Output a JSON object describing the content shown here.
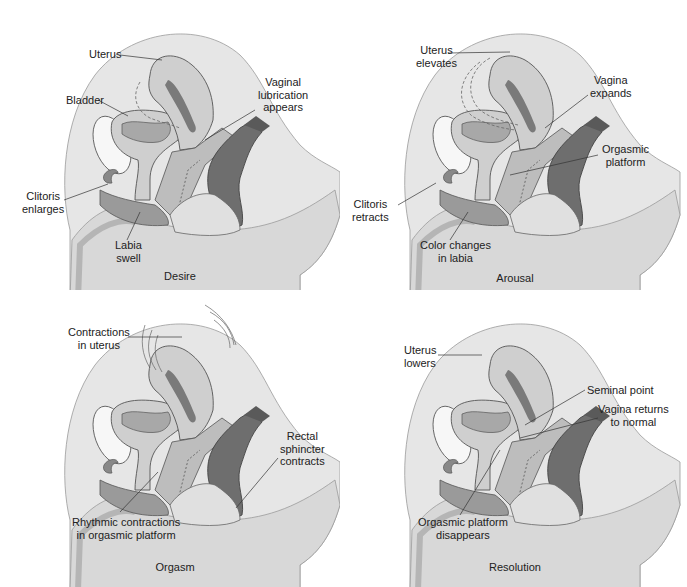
{
  "figure": {
    "panels": [
      {
        "caption": "Desire",
        "labels": {
          "uterus": "Uterus",
          "bladder": "Bladder",
          "vaginal_lubrication_1": "Vaginal",
          "vaginal_lubrication_2": "lubrication",
          "vaginal_lubrication_3": "appears",
          "clitoris_1": "Clitoris",
          "clitoris_2": "enlarges",
          "labia_1": "Labia",
          "labia_2": "swell"
        }
      },
      {
        "caption": "Arousal",
        "labels": {
          "uterus_1": "Uterus",
          "uterus_2": "elevates",
          "vagina_1": "Vagina",
          "vagina_2": "expands",
          "platform_1": "Orgasmic",
          "platform_2": "platform",
          "clitoris_1": "Clitoris",
          "clitoris_2": "retracts",
          "labia_1": "Color changes",
          "labia_2": "in labia"
        }
      },
      {
        "caption": "Orgasm",
        "labels": {
          "uterus_1": "Contractions",
          "uterus_2": "in uterus",
          "rectal_1": "Rectal",
          "rectal_2": "sphincter",
          "rectal_3": "contracts",
          "platform_1": "Rhythmic contractions",
          "platform_2": "in orgasmic platform"
        }
      },
      {
        "caption": "Resolution",
        "labels": {
          "uterus_1": "Uterus",
          "uterus_2": "lowers",
          "seminal": "Seminal point",
          "vagina_1": "Vagina returns",
          "vagina_2": "to normal",
          "platform_1": "Orgasmic platform",
          "platform_2": "disappears"
        }
      }
    ],
    "colors": {
      "body_light": "#e6e6e6",
      "body_mid": "#d2d2d2",
      "organ": "#c4c4c4",
      "organ_dark": "#8a8a8a",
      "rectum": "#6e6e6e",
      "outline": "#555555",
      "bone": "#f7f7f7"
    }
  }
}
